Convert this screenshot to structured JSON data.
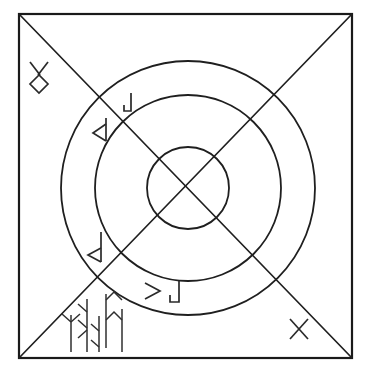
{
  "figure": {
    "background_color": "#ffffff",
    "stroke_color": "#1f1f1f",
    "width": 371,
    "height": 374
  },
  "frame": {
    "name": "outer-square",
    "left": 19,
    "top": 14,
    "right": 352,
    "bottom": 358,
    "stroke_color": "#1a1a1a",
    "stroke_width": 2.2
  },
  "diagonals": [
    {
      "name": "diagonal-tl-br",
      "x1": 19,
      "y1": 14,
      "x2": 352,
      "y2": 358
    },
    {
      "name": "diagonal-tr-bl",
      "x1": 352,
      "y1": 14,
      "x2": 19,
      "y2": 358
    }
  ],
  "circles": {
    "center_x": 188,
    "center_y": 188,
    "rings": [
      {
        "name": "outer-ring",
        "radius": 127
      },
      {
        "name": "middle-ring",
        "radius": 93
      },
      {
        "name": "inner-ring",
        "radius": 41
      }
    ]
  },
  "glyphs": [
    {
      "name": "glyph-x-over-diamond",
      "label": "X over diamond",
      "position": "upper-left-corner",
      "x": 39,
      "y": 78
    },
    {
      "name": "glyph-hook-top",
      "label": "hook / J stroke",
      "position": "upper-ring-band",
      "x": 127,
      "y": 103
    },
    {
      "name": "glyph-left-triangle",
      "label": "left-pointing triangle on stave",
      "position": "left-upper-ring-band",
      "x": 99,
      "y": 131
    },
    {
      "name": "glyph-stave-triangle",
      "label": "stave with left-pointing triangle",
      "position": "left-lower-ring-band",
      "x": 96,
      "y": 245
    },
    {
      "name": "glyph-chevron",
      "label": "right-pointing chevron",
      "position": "lower-ring-band",
      "x": 151,
      "y": 291
    },
    {
      "name": "glyph-hook-bottom",
      "label": "hook / J stroke",
      "position": "lower-ring-band",
      "x": 173,
      "y": 292
    },
    {
      "name": "glyph-algiz",
      "label": "Y-branched stave",
      "position": "bottom-left-cluster",
      "x": 71,
      "y": 330
    },
    {
      "name": "glyph-branched-stave",
      "label": "stave with downward branches",
      "position": "bottom-left-cluster",
      "x": 88,
      "y": 318
    },
    {
      "name": "glyph-fehu",
      "label": "stave with two upward arms",
      "position": "bottom-left-cluster",
      "x": 104,
      "y": 312
    },
    {
      "name": "glyph-isa",
      "label": "plain vertical stave",
      "position": "bottom-left-cluster",
      "x": 119,
      "y": 315
    },
    {
      "name": "glyph-x-corner",
      "label": "X cross",
      "position": "lower-right-corner",
      "x": 299,
      "y": 329
    }
  ]
}
